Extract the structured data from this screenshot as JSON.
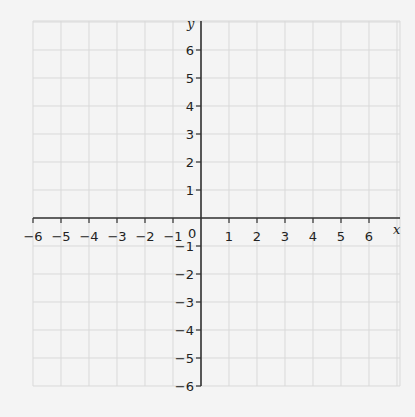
{
  "chart_data": {
    "type": "scatter",
    "title": "",
    "xlabel": "x",
    "ylabel": "y",
    "xlim": [
      -6,
      7
    ],
    "ylim": [
      -6,
      7
    ],
    "x_ticks": [
      -6,
      -5,
      -4,
      -3,
      -2,
      -1,
      1,
      2,
      3,
      4,
      5,
      6
    ],
    "y_ticks": [
      6,
      5,
      4,
      3,
      2,
      1,
      -1,
      -2,
      -3,
      -4,
      -5,
      -6
    ],
    "origin_label": "0",
    "grid": true,
    "series": []
  },
  "layout": {
    "origin_px": [
      201,
      218
    ],
    "unit_px": 28,
    "grid_left": 33,
    "grid_right": 400,
    "grid_top": 21,
    "grid_bottom": 386
  },
  "colors": {
    "grid": "#d9d9d9",
    "axis": "#333333",
    "background": "#f4f4f4"
  }
}
